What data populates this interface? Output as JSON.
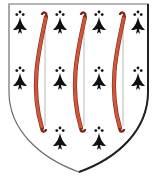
{
  "image": {
    "width": 157,
    "height": 178,
    "subject": "heraldic-shield",
    "blazon": "Ermine, three bows palewise gules"
  },
  "colors": {
    "field": "#ffffff",
    "ermine": "#111111",
    "bow": "#d2553a",
    "bow_shadow": "#7a2a1c",
    "string": "#b8b8b8",
    "outline": "#6e6e6e",
    "outline_dark": "#222222"
  },
  "shield": {
    "path": "M9,4 L148,4 L148,92 C148,130 118,158 79,172 C40,158 9,130 9,92 Z"
  },
  "bows": [
    {
      "string_x": 44,
      "top_y": 13,
      "bottom_y": 128
    },
    {
      "string_x": 83,
      "top_y": 13,
      "bottom_y": 128
    },
    {
      "string_x": 122,
      "top_y": 13,
      "bottom_y": 128
    }
  ],
  "ermine_spots": [
    {
      "x": 20,
      "y": 12
    },
    {
      "x": 60,
      "y": 12
    },
    {
      "x": 99,
      "y": 12
    },
    {
      "x": 138,
      "y": 12
    },
    {
      "x": 20,
      "y": 68
    },
    {
      "x": 60,
      "y": 68
    },
    {
      "x": 99,
      "y": 68
    },
    {
      "x": 138,
      "y": 68
    },
    {
      "x": 60,
      "y": 128
    },
    {
      "x": 99,
      "y": 128
    }
  ]
}
